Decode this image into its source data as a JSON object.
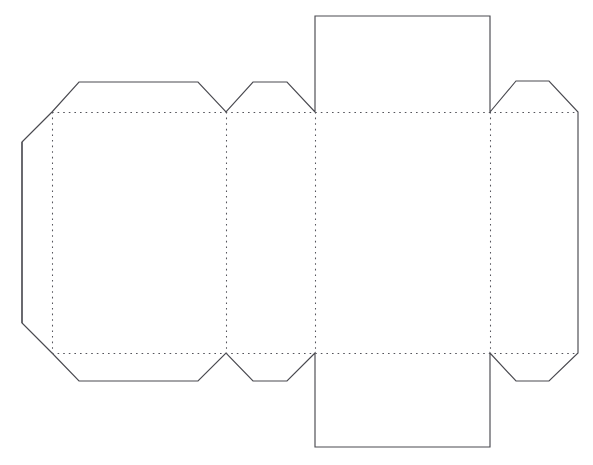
{
  "document": {
    "title": "Box Die-Cut Template",
    "description": "Flat unfolded paper box net with tuck flaps, side glue flaps and dotted fold lines",
    "background_color": "#ffffff",
    "cut_line_color": "#4a4a50",
    "fold_line_color": "#55555c",
    "canvas": {
      "width": 593,
      "height": 465
    }
  },
  "artifact": {
    "clipped_caption": "",
    "visible": "partial"
  },
  "geometry": {
    "x": {
      "left_edge": 22,
      "fold_1": 52,
      "panel1_flap_left": 79,
      "panel1_flap_right": 198,
      "fold_2": 226,
      "panel2_flap_left": 253,
      "panel2_flap_right": 287,
      "fold_3": 315,
      "fold_4": 490,
      "right_flap_left": 516,
      "right_flap_right": 549,
      "right_edge": 578
    },
    "y": {
      "tuck_top": 16,
      "flap_top": 81,
      "fold_top": 112,
      "fold_bottom": 353,
      "flap_bottom": 381,
      "tuck_bottom": 447
    }
  },
  "shapes": {
    "outline_path": "M 22 142 L 52 112 L 79 82 L 198 82 L 226 112 L 253 82 L 287 82 L 315 112 L 315 16 L 490 16 L 490 112 L 516 81 L 549 81 L 578 112 L 578 353 L 549 381 L 516 381 L 490 353 L 490 447 L 315 447 L 315 353 L 287 381 L 253 381 L 226 353 L 198 381 L 79 381 L 52 353 L 22 323 Z",
    "fold_lines": [
      {
        "name": "fold-horizontal-top",
        "x1": 52,
        "y1": 112,
        "x2": 578,
        "y2": 112
      },
      {
        "name": "fold-horizontal-bottom",
        "x1": 52,
        "y1": 353,
        "x2": 578,
        "y2": 353
      },
      {
        "name": "fold-vertical-1",
        "x1": 52,
        "y1": 112,
        "x2": 52,
        "y2": 353
      },
      {
        "name": "fold-vertical-2",
        "x1": 226,
        "y1": 112,
        "x2": 226,
        "y2": 353
      },
      {
        "name": "fold-vertical-3",
        "x1": 315,
        "y1": 112,
        "x2": 315,
        "y2": 353
      },
      {
        "name": "fold-vertical-4",
        "x1": 490,
        "y1": 112,
        "x2": 490,
        "y2": 353
      }
    ]
  },
  "panels": [
    {
      "name": "front-panel",
      "label": "",
      "x": 52,
      "y": 112,
      "width": 174,
      "height": 241
    },
    {
      "name": "side-panel-left",
      "label": "",
      "x": 226,
      "y": 112,
      "width": 89,
      "height": 241
    },
    {
      "name": "back-panel",
      "label": "",
      "x": 315,
      "y": 112,
      "width": 175,
      "height": 241
    },
    {
      "name": "side-panel-right",
      "label": "",
      "x": 490,
      "y": 112,
      "width": 88,
      "height": 241
    }
  ],
  "flaps": [
    {
      "name": "glue-flap-left",
      "label": "",
      "type": "chamfered-side"
    },
    {
      "name": "top-flap-panel-1",
      "label": "",
      "type": "trapezoid"
    },
    {
      "name": "top-flap-panel-2",
      "label": "",
      "type": "trapezoid"
    },
    {
      "name": "top-tuck-flap",
      "label": "",
      "type": "rectangular"
    },
    {
      "name": "top-flap-right",
      "label": "",
      "type": "trapezoid"
    },
    {
      "name": "bottom-flap-panel-1",
      "label": "",
      "type": "trapezoid"
    },
    {
      "name": "bottom-flap-panel-2",
      "label": "",
      "type": "trapezoid"
    },
    {
      "name": "bottom-tuck-flap",
      "label": "",
      "type": "rectangular"
    },
    {
      "name": "bottom-flap-right",
      "label": "",
      "type": "trapezoid"
    }
  ]
}
